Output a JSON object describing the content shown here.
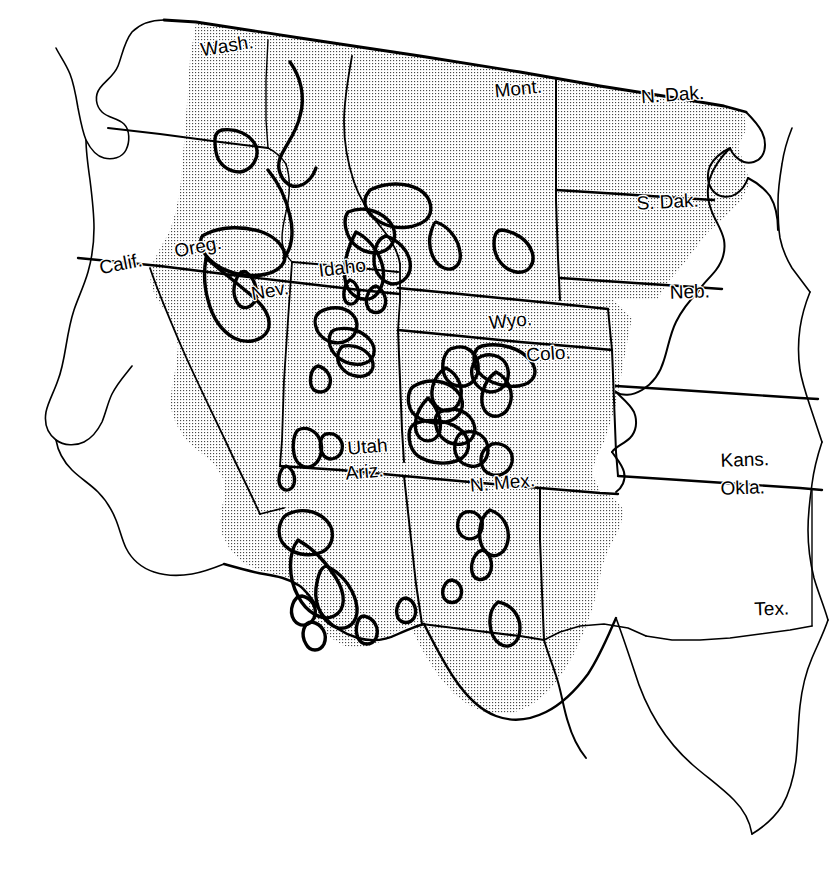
{
  "map": {
    "title": "Western United States",
    "projection_note": "tilted / oblique orientation",
    "background_color": "#ffffff",
    "ink_color": "#000000",
    "shading": {
      "name": "stipple-halftone-fill",
      "description": "fine dot screen tint marking the mountainous arid West",
      "dot_color": "#3a3a3a",
      "tint_color": "#e8e8e8",
      "dot_spacing_px": 3
    },
    "stroke_weights": {
      "outer_boundary": 2.6,
      "state_border": 2.2,
      "river_border": 1.4,
      "mountain_outline": 3.4,
      "coastline": 1.6
    },
    "label_font_size_px": 19,
    "labels": [
      {
        "id": "wash",
        "text": "Wash.",
        "x": 228,
        "y": 52,
        "rotate": -9,
        "anchor": "middle"
      },
      {
        "id": "oreg",
        "text": "Oreg.",
        "x": 199,
        "y": 253,
        "rotate": -11,
        "anchor": "middle"
      },
      {
        "id": "calif",
        "text": "Calif.",
        "x": 122,
        "y": 270,
        "rotate": -11,
        "anchor": "middle"
      },
      {
        "id": "idaho",
        "text": "Idaho",
        "x": 343,
        "y": 274,
        "rotate": -7,
        "anchor": "middle"
      },
      {
        "id": "nev",
        "text": "Nev.",
        "x": 271,
        "y": 297,
        "rotate": -10,
        "anchor": "middle"
      },
      {
        "id": "mont",
        "text": "Mont.",
        "x": 519,
        "y": 95,
        "rotate": -6,
        "anchor": "middle"
      },
      {
        "id": "ndak",
        "text": "N. Dak.",
        "x": 673,
        "y": 101,
        "rotate": -4,
        "anchor": "middle"
      },
      {
        "id": "sdak",
        "text": "S. Dak.",
        "x": 668,
        "y": 208,
        "rotate": -3,
        "anchor": "middle"
      },
      {
        "id": "neb",
        "text": "Neb.",
        "x": 690,
        "y": 298,
        "rotate": -2,
        "anchor": "middle"
      },
      {
        "id": "wyo",
        "text": "Wyo.",
        "x": 511,
        "y": 327,
        "rotate": -5,
        "anchor": "middle"
      },
      {
        "id": "colo",
        "text": "Colo.",
        "x": 549,
        "y": 360,
        "rotate": -4,
        "anchor": "middle"
      },
      {
        "id": "utah",
        "text": "Utah",
        "x": 368,
        "y": 453,
        "rotate": -5,
        "anchor": "middle"
      },
      {
        "id": "ariz",
        "text": "Ariz.",
        "x": 365,
        "y": 478,
        "rotate": -5,
        "anchor": "middle"
      },
      {
        "id": "nmex",
        "text": "N. Mex.",
        "x": 503,
        "y": 489,
        "rotate": -5,
        "anchor": "middle"
      },
      {
        "id": "kans",
        "text": "Kans.",
        "x": 745,
        "y": 466,
        "rotate": -2,
        "anchor": "middle"
      },
      {
        "id": "okla",
        "text": "Okla.",
        "x": 743,
        "y": 494,
        "rotate": -2,
        "anchor": "middle"
      },
      {
        "id": "tex",
        "text": "Tex.",
        "x": 772,
        "y": 615,
        "rotate": -2,
        "anchor": "middle"
      }
    ],
    "states_shaded": [
      "Wash.",
      "Oreg.",
      "Calif.",
      "Idaho",
      "Nev.",
      "Mont.",
      "N. Dak.",
      "S. Dak.",
      "Wyo.",
      "Colo.",
      "Utah",
      "Ariz.",
      "N. Mex."
    ],
    "states_unshaded": [
      "Neb.",
      "Kans.",
      "Okla.",
      "Tex."
    ]
  }
}
